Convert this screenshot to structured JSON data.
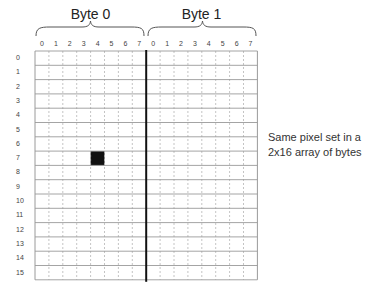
{
  "diagram": {
    "bytes": [
      {
        "title": "Byte 0",
        "bits": [
          "0",
          "1",
          "2",
          "3",
          "4",
          "5",
          "6",
          "7"
        ]
      },
      {
        "title": "Byte 1",
        "bits": [
          "0",
          "1",
          "2",
          "3",
          "4",
          "5",
          "6",
          "7"
        ]
      }
    ],
    "rows": [
      "0",
      "1",
      "2",
      "3",
      "4",
      "5",
      "6",
      "7",
      "8",
      "9",
      "10",
      "11",
      "12",
      "13",
      "14",
      "15"
    ],
    "set_pixel": {
      "byte": 0,
      "bit": 4,
      "row": 7
    },
    "caption_line1": "Same pixel set in a",
    "caption_line2": "2x16 array of bytes",
    "colors": {
      "grid_line": "#9a9a9a",
      "dotted_line": "#b5b5b5",
      "divider": "#111111",
      "pixel": "#111111"
    }
  }
}
